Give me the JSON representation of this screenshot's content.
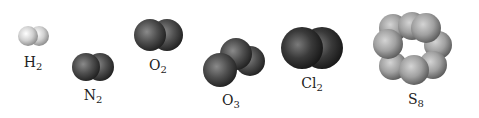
{
  "molecules": [
    {
      "id": "h2",
      "element": "H",
      "subscript": "2",
      "label_x": 33,
      "label_y": 55,
      "color": "#d8d8d8"
    },
    {
      "id": "n2",
      "element": "N",
      "subscript": "2",
      "label_x": 93,
      "label_y": 88,
      "color": "#444444"
    },
    {
      "id": "o2",
      "element": "O",
      "subscript": "2",
      "label_x": 158,
      "label_y": 58,
      "color": "#4a4a4a"
    },
    {
      "id": "o3",
      "element": "O",
      "subscript": "3",
      "label_x": 231,
      "label_y": 93,
      "color": "#4a4a4a"
    },
    {
      "id": "cl2",
      "element": "Cl",
      "subscript": "2",
      "label_x": 312,
      "label_y": 76,
      "color": "#2e2e2e"
    },
    {
      "id": "s8",
      "element": "S",
      "subscript": "8",
      "label_x": 416,
      "label_y": 92,
      "color": "#9a9a9a"
    }
  ]
}
